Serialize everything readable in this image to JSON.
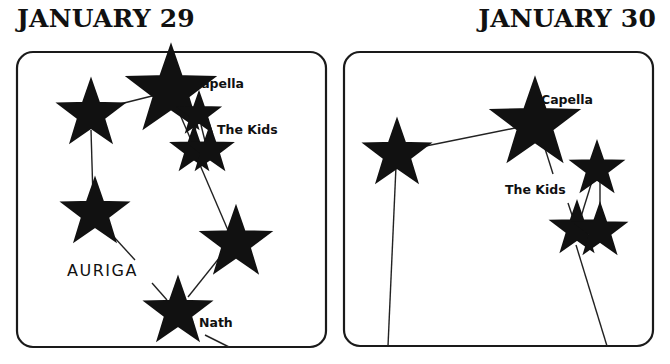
{
  "panels": [
    {
      "title": "JANUARY 29",
      "labels": {
        "capella": "Capella",
        "kids": "The Kids",
        "constellation": "AURIGA",
        "nath": "Nath"
      }
    },
    {
      "title": "JANUARY 30",
      "labels": {
        "capella": "Capella",
        "kids": "The Kids"
      }
    }
  ]
}
